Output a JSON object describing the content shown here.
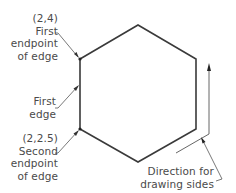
{
  "diagram": {
    "shape": "hexagon",
    "colors": {
      "stroke": "#3a3a3a",
      "text": "#4a4a4a",
      "background": "#ffffff"
    },
    "annotations": {
      "first_endpoint": {
        "coords": "(2,4)",
        "line1": "First",
        "line2": "endpoint",
        "line3": "of edge"
      },
      "first_edge": {
        "line1": "First",
        "line2": "edge"
      },
      "second_endpoint": {
        "coords": "(2,2.5)",
        "line1": "Second",
        "line2": "endpoint",
        "line3": "of edge"
      },
      "direction": {
        "line1": "Direction for",
        "line2": "drawing sides"
      }
    }
  }
}
